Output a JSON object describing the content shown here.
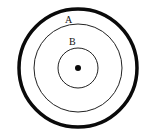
{
  "diagram": {
    "labels": {
      "a": "A",
      "b": "B"
    },
    "colors": {
      "stroke": "#0a0a0a",
      "background": "#ffffff"
    },
    "shapes": [
      {
        "name": "outer-circle",
        "cx": 78,
        "cy": 68,
        "r": 59,
        "stroke_width": 3.5
      },
      {
        "name": "circle-a",
        "cx": 78,
        "cy": 68,
        "r": 44,
        "stroke_width": 1
      },
      {
        "name": "circle-b",
        "cx": 78,
        "cy": 68,
        "r": 20,
        "stroke_width": 1
      },
      {
        "name": "center-dot",
        "cx": 78,
        "cy": 68,
        "r": 3
      }
    ]
  }
}
